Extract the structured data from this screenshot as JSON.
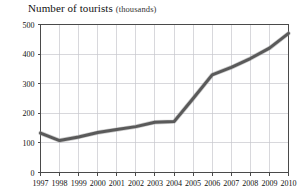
{
  "title": {
    "main": "Number of tourists",
    "unit": "(thousands)"
  },
  "chart_data": {
    "type": "line",
    "title": "Number of tourists (thousands)",
    "xlabel": "",
    "ylabel": "",
    "unit": "thousands",
    "categories": [
      "1997",
      "1998",
      "1999",
      "2000",
      "2001",
      "2002",
      "2003",
      "2004",
      "2005",
      "2006",
      "2007",
      "2008",
      "2009",
      "2010"
    ],
    "x": [
      1997,
      1998,
      1999,
      2000,
      2001,
      2002,
      2003,
      2004,
      2005,
      2006,
      2007,
      2008,
      2009,
      2010
    ],
    "values": [
      133,
      108,
      120,
      135,
      145,
      155,
      170,
      172,
      250,
      330,
      355,
      385,
      420,
      470
    ],
    "series": [
      {
        "name": "Number of tourists",
        "values": [
          133,
          108,
          120,
          135,
          145,
          155,
          170,
          172,
          250,
          330,
          355,
          385,
          420,
          470
        ],
        "color": "#5a5a5a"
      }
    ],
    "ylim": [
      0,
      500
    ],
    "yticks": [
      0,
      100,
      200,
      300,
      400,
      500
    ],
    "ytick_labels": [
      "0",
      "100",
      "200",
      "300",
      "400",
      "500"
    ],
    "xtick_labels": [
      "1997",
      "1998",
      "1999",
      "2000",
      "2001",
      "2002",
      "2003",
      "2004",
      "2005",
      "2006",
      "2007",
      "2008",
      "2009",
      "2010"
    ],
    "grid": true,
    "grid_color": "#c8c8cd",
    "legend": false,
    "legend_position": "none",
    "line_color": "#5a5a5a",
    "axis_color": "#4a4a4a",
    "background": "#ffffff"
  }
}
